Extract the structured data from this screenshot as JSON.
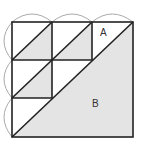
{
  "diagram": {
    "type": "square-grid-triangle-figure",
    "grid": {
      "rows": 3,
      "cols": 3
    },
    "square": {
      "x": 12,
      "y": 22,
      "size": 121
    },
    "colors": {
      "stroke": "#222222",
      "fill": "#e4e4e4",
      "arc": "#aaaaaa",
      "background": "#ffffff"
    },
    "labels": {
      "A": "A",
      "B": "B"
    },
    "regions": [
      {
        "name": "A",
        "description": "white triangle above main diagonal in top-right cell"
      },
      {
        "name": "B",
        "description": "large shaded triangle below main diagonal"
      }
    ]
  }
}
